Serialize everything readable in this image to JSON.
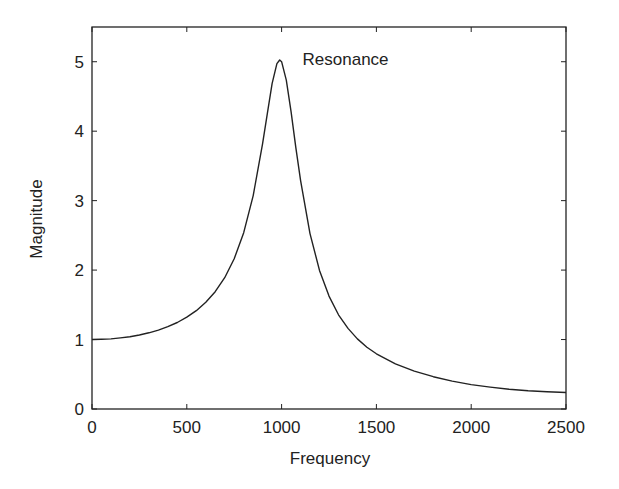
{
  "chart_data": {
    "type": "line",
    "title": "",
    "xlabel": "Frequency",
    "ylabel": "Magnitude",
    "xlim": [
      0,
      2500
    ],
    "ylim": [
      0,
      5.5
    ],
    "grid": false,
    "legend": null,
    "x_ticks": [
      0,
      500,
      1000,
      1500,
      2000,
      2500
    ],
    "y_ticks": [
      0,
      1,
      2,
      3,
      4,
      5
    ],
    "x_tick_labels": [
      "0",
      "500",
      "1000",
      "1500",
      "2000",
      "2500"
    ],
    "y_tick_labels": [
      "0",
      "1",
      "2",
      "3",
      "4",
      "5"
    ],
    "annotations": [
      {
        "text": "Resonance",
        "x": 1100,
        "y": 5.0
      }
    ],
    "series": [
      {
        "name": "Magnitude response",
        "color": "#222222",
        "x": [
          0,
          50,
          100,
          150,
          200,
          250,
          300,
          350,
          400,
          450,
          500,
          550,
          600,
          650,
          700,
          750,
          800,
          850,
          900,
          925,
          950,
          975,
          990,
          1000,
          1025,
          1050,
          1075,
          1100,
          1150,
          1200,
          1250,
          1300,
          1350,
          1400,
          1450,
          1500,
          1600,
          1700,
          1800,
          1900,
          2000,
          2100,
          2200,
          2300,
          2400,
          2500
        ],
        "values": [
          1.0,
          1.003,
          1.01,
          1.023,
          1.041,
          1.065,
          1.097,
          1.136,
          1.185,
          1.246,
          1.322,
          1.416,
          1.536,
          1.689,
          1.891,
          2.162,
          2.538,
          3.073,
          3.821,
          4.261,
          4.684,
          4.971,
          5.025,
          5.0,
          4.735,
          4.279,
          3.768,
          3.288,
          2.525,
          1.995,
          1.625,
          1.356,
          1.16,
          1.01,
          0.89,
          0.795,
          0.65,
          0.545,
          0.465,
          0.402,
          0.352,
          0.315,
          0.285,
          0.262,
          0.248,
          0.238
        ]
      }
    ]
  }
}
